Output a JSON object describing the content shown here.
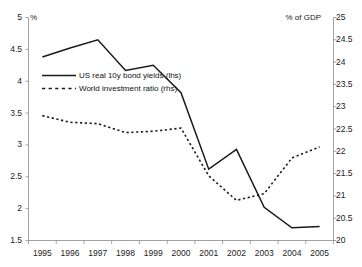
{
  "chart_data": {
    "type": "line",
    "title": "",
    "xlabel": "",
    "ylabel": "%",
    "y2label": "% of GDP",
    "grid": false,
    "legend_position": "inside-upper-left",
    "categories": [
      "1995",
      "1996",
      "1997",
      "1998",
      "1999",
      "2000",
      "2001",
      "2002",
      "2003",
      "2004",
      "2005"
    ],
    "x": [
      1995,
      1996,
      1997,
      1998,
      1999,
      2000,
      2001,
      2002,
      2003,
      2004,
      2005
    ],
    "ylim": [
      1.5,
      5.0
    ],
    "y2lim": [
      20,
      25
    ],
    "yticks": [
      "1.5",
      "2",
      "2.5",
      "3",
      "3.5",
      "4",
      "4.5",
      "5"
    ],
    "y2ticks": [
      "20",
      "20.5",
      "21",
      "21.5",
      "22",
      "22.5",
      "23",
      "23.5",
      "24",
      "24.5",
      "25"
    ],
    "series": [
      {
        "name": "US real 10y bond yields (lhs)",
        "axis": "left",
        "style": "solid",
        "color": "#1a1a1a",
        "values": [
          4.38,
          4.52,
          4.65,
          4.17,
          4.25,
          3.82,
          2.62,
          2.93,
          2.02,
          1.7,
          1.72
        ]
      },
      {
        "name": "World investment ratio (rhs)",
        "axis": "right",
        "style": "dashed",
        "color": "#1a1a1a",
        "values": [
          22.8,
          22.65,
          22.62,
          22.42,
          22.45,
          22.52,
          21.45,
          20.9,
          21.05,
          21.85,
          22.1
        ]
      }
    ]
  },
  "axes": {
    "left_unit": "%",
    "right_unit": "% of GDP"
  },
  "legend": {
    "entries": [
      {
        "label": "US real 10y bond yields (lhs)",
        "style": "solid"
      },
      {
        "label": "World investment ratio (rhs)",
        "style": "dashed"
      }
    ]
  }
}
